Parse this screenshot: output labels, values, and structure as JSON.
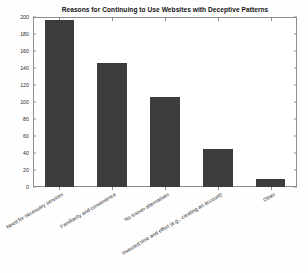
{
  "chart_data": {
    "type": "bar",
    "title": "Reasons for Continuing to Use Websites with Deceptive Patterns",
    "xlabel": "",
    "ylabel": "Frequency",
    "categories": [
      "Need for necessary services",
      "Familiarity and convenience",
      "No known alternatives",
      "Invested time and effort (e.g., creating an account)",
      "Other"
    ],
    "values": [
      197,
      146,
      106,
      45,
      10
    ],
    "ylim": [
      0,
      200
    ],
    "yticks": [
      0,
      20,
      40,
      60,
      80,
      100,
      120,
      140,
      160,
      180,
      200
    ],
    "grid": false,
    "legend": null,
    "bar_color": "#3c3c3c",
    "axis_color": "#8d8d8d",
    "text_color": "#2b2b2b"
  }
}
